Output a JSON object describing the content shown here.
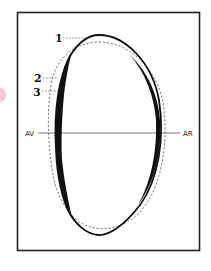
{
  "diagram": {
    "type": "tooth-cross-section-outline",
    "labels": {
      "callout_1": "1",
      "callout_2": "2",
      "callout_3": "3",
      "axis_left": "AV",
      "axis_right": "AR"
    },
    "legend_meaning": {
      "1": "solid outline",
      "2": "dashed outline",
      "3": "filled wear region"
    },
    "colors": {
      "stroke": "#111111",
      "dashed": "#555555",
      "frame": "#222222",
      "background": "#ffffff",
      "accent_mark": "#f6c6d4"
    }
  }
}
